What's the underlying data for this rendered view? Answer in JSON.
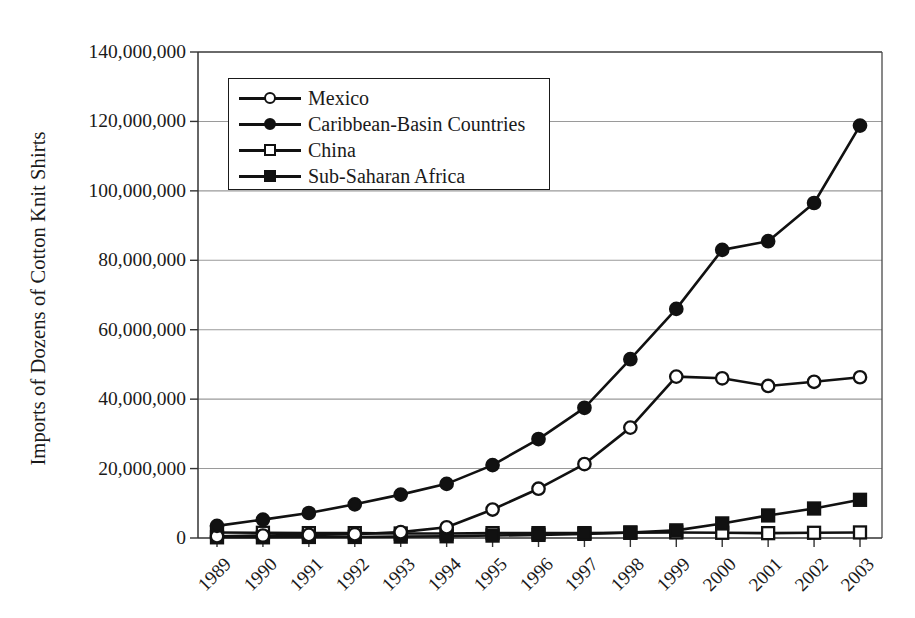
{
  "chart_data": {
    "type": "line",
    "title": "",
    "xlabel": "",
    "ylabel": "Imports of Dozens of Cotton Knit Shirts",
    "categories": [
      "1989",
      "1990",
      "1991",
      "1992",
      "1993",
      "1994",
      "1995",
      "1996",
      "1997",
      "1998",
      "1999",
      "2000",
      "2001",
      "2002",
      "2003"
    ],
    "ylim": [
      0,
      140000000
    ],
    "ytick_values": [
      0,
      20000000,
      40000000,
      60000000,
      80000000,
      100000000,
      120000000,
      140000000
    ],
    "ytick_labels": [
      "0",
      "20,000,000",
      "40,000,000",
      "60,000,000",
      "80,000,000",
      "100,000,000",
      "120,000,000",
      "140,000,000"
    ],
    "grid": "horizontal",
    "legend_position": "upper-left-inside",
    "series": [
      {
        "name": "Mexico",
        "marker": "circle-open",
        "color": "#111111",
        "values": [
          500000,
          700000,
          900000,
          1100000,
          1700000,
          3100000,
          8200000,
          14200000,
          21300000,
          31800000,
          46500000,
          46000000,
          43800000,
          45000000,
          46300000
        ]
      },
      {
        "name": "Caribbean-Basin Countries",
        "marker": "circle-filled",
        "color": "#111111",
        "values": [
          3500000,
          5300000,
          7200000,
          9700000,
          12500000,
          15600000,
          21000000,
          28500000,
          37500000,
          51500000,
          66000000,
          83000000,
          85500000,
          96500000,
          118800000
        ]
      },
      {
        "name": "China",
        "marker": "square-open",
        "color": "#111111",
        "values": [
          1600000,
          1500000,
          1400000,
          1400000,
          1300000,
          1300000,
          1400000,
          1400000,
          1400000,
          1500000,
          1600000,
          1500000,
          1400000,
          1500000,
          1600000
        ]
      },
      {
        "name": "Sub-Saharan Africa",
        "marker": "square-filled",
        "color": "#111111",
        "values": [
          200000,
          200000,
          300000,
          300000,
          400000,
          500000,
          700000,
          900000,
          1200000,
          1600000,
          2200000,
          4200000,
          6500000,
          8500000,
          11000000
        ]
      }
    ]
  },
  "legend": {
    "items": [
      {
        "label": "Mexico",
        "marker": "circle-open"
      },
      {
        "label": "Caribbean-Basin Countries",
        "marker": "circle-filled"
      },
      {
        "label": "China",
        "marker": "square-open"
      },
      {
        "label": "Sub-Saharan Africa",
        "marker": "square-filled"
      }
    ]
  },
  "axes": {
    "y_title": "Imports of Dozens of Cotton Knit Shirts"
  }
}
